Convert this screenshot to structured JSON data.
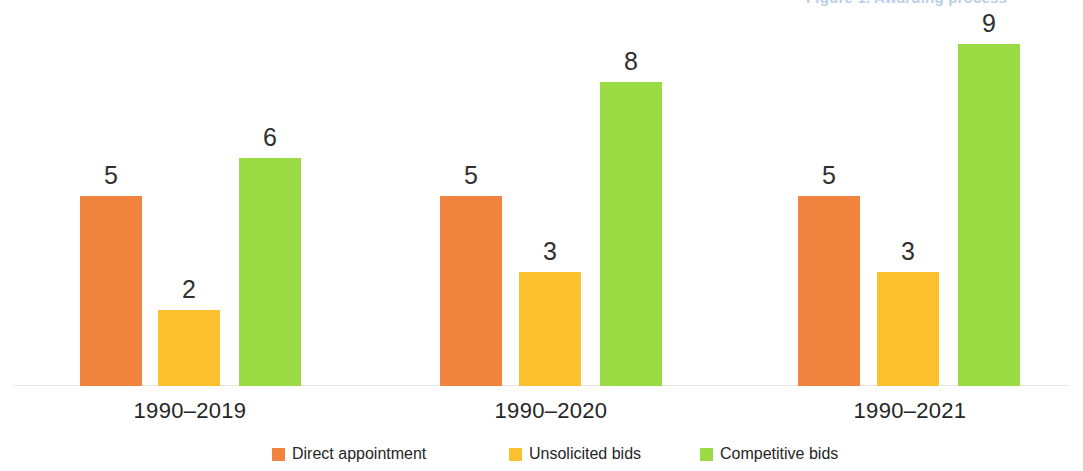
{
  "header": {
    "clipped_text": "Figure 1. Awarding process"
  },
  "chart_data": {
    "type": "bar",
    "title": "",
    "subtitle": "",
    "xlabel": "",
    "ylabel": "",
    "ylim": [
      0,
      10
    ],
    "grid": false,
    "legend_position": "bottom-center",
    "orientation": "vertical",
    "grouping": "grouped",
    "data_labels": true,
    "categories": [
      "1990–2019",
      "1990–2020",
      "1990–2021"
    ],
    "series": [
      {
        "name": "Direct appointment",
        "color": "#F1843E",
        "values": [
          5,
          2,
          6
        ]
      },
      {
        "name": "Unsolicited bids",
        "color": "#FBC02D",
        "values": [
          5,
          3,
          8
        ]
      },
      {
        "name": "Competitive bids",
        "color": "#9BDC45",
        "values": [
          5,
          3,
          9
        ]
      }
    ],
    "groups": [
      {
        "category": "1990–2019",
        "bars": [
          {
            "series": "Direct appointment",
            "value": 5,
            "label": "5",
            "color": "#F1843E"
          },
          {
            "series": "Unsolicited bids",
            "value": 2,
            "label": "2",
            "color": "#FBC02D"
          },
          {
            "series": "Competitive bids",
            "value": 6,
            "label": "6",
            "color": "#9BDC45"
          }
        ]
      },
      {
        "category": "1990–2020",
        "bars": [
          {
            "series": "Direct appointment",
            "value": 5,
            "label": "5",
            "color": "#F1843E"
          },
          {
            "series": "Unsolicited bids",
            "value": 3,
            "label": "3",
            "color": "#FBC02D"
          },
          {
            "series": "Competitive bids",
            "value": 8,
            "label": "8",
            "color": "#9BDC45"
          }
        ]
      },
      {
        "category": "1990–2021",
        "bars": [
          {
            "series": "Direct appointment",
            "value": 5,
            "label": "5",
            "color": "#F1843E"
          },
          {
            "series": "Unsolicited bids",
            "value": 3,
            "label": "3",
            "color": "#FBC02D"
          },
          {
            "series": "Competitive bids",
            "value": 9,
            "label": "9",
            "color": "#9BDC45"
          }
        ]
      }
    ]
  },
  "legend": {
    "items": [
      {
        "label": "Direct appointment",
        "color": "#F1843E"
      },
      {
        "label": "Unsolicited bids",
        "color": "#FBC02D"
      },
      {
        "label": "Competitive bids",
        "color": "#9BDC45"
      }
    ]
  },
  "layout": {
    "baseline_y": 386,
    "px_per_unit": 38,
    "bar_width": 62,
    "bar_lefts": [
      [
        80,
        158,
        239
      ],
      [
        440,
        519,
        600
      ],
      [
        798,
        877,
        958
      ]
    ],
    "category_centers": [
      190,
      551,
      910
    ],
    "legend_lefts": [
      272,
      509,
      700
    ]
  }
}
